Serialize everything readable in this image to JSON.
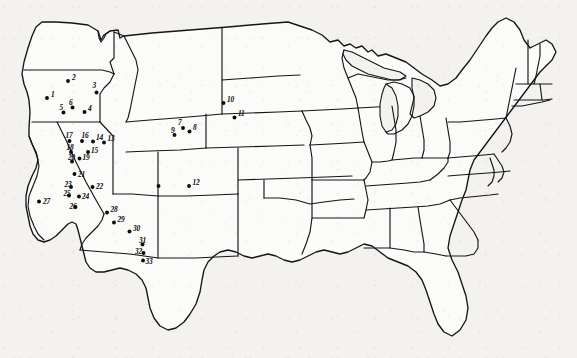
{
  "figure": {
    "background_color": "#f3f2f0",
    "ink_color": "#151515",
    "dot_color": "#0a0a0a",
    "width": 577,
    "height": 358
  },
  "sites": [
    {
      "label": "1",
      "x": 47.0,
      "y": 98.0,
      "lx": 51.0,
      "ly": 96.5,
      "region": "Oregon"
    },
    {
      "label": "2",
      "x": 68.0,
      "y": 81.0,
      "lx": 72.0,
      "ly": 79.5,
      "region": "Oregon"
    },
    {
      "label": "3",
      "x": 96.5,
      "y": 92.5,
      "lx": 92.5,
      "ly": 87.5,
      "region": "Oregon"
    },
    {
      "label": "4",
      "x": 84.5,
      "y": 112.0,
      "lx": 88.0,
      "ly": 110.5,
      "region": "Oregon"
    },
    {
      "label": "5",
      "x": 63.5,
      "y": 112.5,
      "lx": 59.5,
      "ly": 110.0,
      "region": "Oregon"
    },
    {
      "label": "6",
      "x": 72.5,
      "y": 107.5,
      "lx": 69.0,
      "ly": 104.5,
      "region": "Oregon"
    },
    {
      "label": "7",
      "x": 183.0,
      "y": 128.0,
      "lx": 178.0,
      "ly": 125.0,
      "region": "Wyoming"
    },
    {
      "label": "8",
      "x": 189.5,
      "y": 131.5,
      "lx": 193.0,
      "ly": 130.0,
      "region": "Wyoming"
    },
    {
      "label": "9",
      "x": 174.5,
      "y": 135.0,
      "lx": 171.0,
      "ly": 133.0,
      "region": "Wyoming"
    },
    {
      "label": "10",
      "x": 223.5,
      "y": 103.0,
      "lx": 227.0,
      "ly": 101.5,
      "region": "South Dakota"
    },
    {
      "label": "11",
      "x": 234.5,
      "y": 117.5,
      "lx": 238.0,
      "ly": 116.0,
      "region": "South Dakota"
    },
    {
      "label": "12",
      "x": 189.0,
      "y": 186.0,
      "lx": 192.5,
      "ly": 184.5,
      "region": "Colorado"
    },
    {
      "label": "13",
      "x": 104.0,
      "y": 142.5,
      "lx": 107.5,
      "ly": 141.0,
      "region": "Nevada"
    },
    {
      "label": "14",
      "x": 93.0,
      "y": 141.5,
      "lx": 96.0,
      "ly": 139.5,
      "region": "Nevada"
    },
    {
      "label": "15",
      "x": 88.0,
      "y": 152.0,
      "lx": 91.0,
      "ly": 152.5,
      "region": "Nevada"
    },
    {
      "label": "16",
      "x": 82.0,
      "y": 141.0,
      "lx": 81.5,
      "ly": 137.5,
      "region": "Nevada"
    },
    {
      "label": "17",
      "x": 69.5,
      "y": 141.0,
      "lx": 65.5,
      "ly": 137.5,
      "region": "Nevada"
    },
    {
      "label": "18",
      "x": 71.0,
      "y": 152.0,
      "lx": 66.5,
      "ly": 150.0,
      "region": "Nevada"
    },
    {
      "label": "19",
      "x": 79.5,
      "y": 158.5,
      "lx": 82.5,
      "ly": 160.0,
      "region": "Nevada"
    },
    {
      "label": "20",
      "x": 72.0,
      "y": 161.5,
      "lx": 68.0,
      "ly": 159.5,
      "region": "Nevada"
    },
    {
      "label": "21",
      "x": 74.5,
      "y": 174.0,
      "lx": 78.0,
      "ly": 176.5,
      "region": "Nevada"
    },
    {
      "label": "22",
      "x": 92.5,
      "y": 187.0,
      "lx": 96.0,
      "ly": 189.0,
      "region": "Nevada"
    },
    {
      "label": "23",
      "x": 71.0,
      "y": 187.0,
      "lx": 64.5,
      "ly": 186.5,
      "region": "California"
    },
    {
      "label": "24",
      "x": 79.0,
      "y": 196.5,
      "lx": 82.0,
      "ly": 198.5,
      "region": "California"
    },
    {
      "label": "25",
      "x": 69.0,
      "y": 195.5,
      "lx": 63.5,
      "ly": 195.5,
      "region": "California"
    },
    {
      "label": "26",
      "x": 75.5,
      "y": 207.0,
      "lx": 69.5,
      "ly": 209.0,
      "region": "California"
    },
    {
      "label": "27",
      "x": 39.0,
      "y": 201.5,
      "lx": 43.0,
      "ly": 203.5,
      "region": "California"
    },
    {
      "label": "28",
      "x": 107.0,
      "y": 212.5,
      "lx": 110.5,
      "ly": 212.0,
      "region": "Arizona"
    },
    {
      "label": "29",
      "x": 114.0,
      "y": 222.5,
      "lx": 117.5,
      "ly": 222.0,
      "region": "Arizona"
    },
    {
      "label": "30",
      "x": 129.5,
      "y": 231.5,
      "lx": 133.0,
      "ly": 231.0,
      "region": "Arizona"
    },
    {
      "label": "31",
      "x": 142.5,
      "y": 244.5,
      "lx": 139.0,
      "ly": 242.5,
      "region": "Arizona"
    },
    {
      "label": "32",
      "x": 143.5,
      "y": 253.0,
      "lx": 135.0,
      "ly": 253.5,
      "region": "Arizona"
    },
    {
      "label": "33",
      "x": 143.0,
      "y": 260.5,
      "lx": 145.5,
      "ly": 263.5,
      "region": "Arizona"
    },
    {
      "label": "",
      "x": 158.5,
      "y": 186.0,
      "lx": 0,
      "ly": 0,
      "region": "Utah"
    }
  ]
}
